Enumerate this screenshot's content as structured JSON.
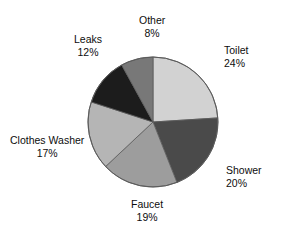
{
  "title": {
    "text": "WATER USE AT HOME",
    "clipped": true
  },
  "chart_data": {
    "type": "pie",
    "title": "WATER USE AT HOME",
    "xlabel": "",
    "ylabel": "",
    "grid": false,
    "legend": "none",
    "label_format": "name above percent",
    "start_angle_deg": 0,
    "direction": "clockwise",
    "categories": [
      "Toilet",
      "Shower",
      "Faucet",
      "Clothes Washer",
      "Leaks",
      "Other"
    ],
    "values": [
      24,
      20,
      19,
      17,
      12,
      8
    ],
    "unit": "%",
    "total": 100,
    "slices": [
      {
        "label": "Toilet",
        "value": 24,
        "display": "24%",
        "color": "#d2d2d2"
      },
      {
        "label": "Shower",
        "value": 20,
        "display": "20%",
        "color": "#4a4a4a"
      },
      {
        "label": "Faucet",
        "value": 19,
        "display": "19%",
        "color": "#9d9d9d"
      },
      {
        "label": "Clothes Washer",
        "value": 17,
        "display": "17%",
        "color": "#b5b5b5"
      },
      {
        "label": "Leaks",
        "value": 12,
        "display": "12%",
        "color": "#1c1c1c"
      },
      {
        "label": "Other",
        "value": 8,
        "display": "8%",
        "color": "#787878"
      }
    ]
  },
  "geometry": {
    "center_x": 153,
    "center_y": 122,
    "radius": 65,
    "outline_color": "#5a5a5a",
    "background": "#ffffff"
  }
}
